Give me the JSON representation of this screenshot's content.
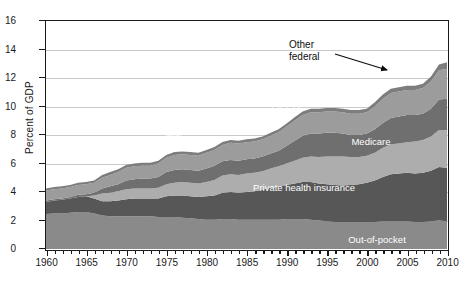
{
  "chart_data": {
    "type": "area",
    "title": "",
    "subtitle": "",
    "xlabel": "",
    "ylabel": "Percent of GDP",
    "xlim": [
      1960,
      2010
    ],
    "ylim": [
      0,
      16
    ],
    "yticks": [
      0,
      2,
      4,
      6,
      8,
      10,
      12,
      14,
      16
    ],
    "xticks": [
      1960,
      1965,
      1970,
      1975,
      1980,
      1985,
      1990,
      1995,
      2000,
      2005,
      2010
    ],
    "xtick_minor_step": 1,
    "grid": "horizontal",
    "legend_position": "inline-labels",
    "stacked": true,
    "x": [
      1960,
      1961,
      1962,
      1963,
      1964,
      1965,
      1966,
      1967,
      1968,
      1969,
      1970,
      1971,
      1972,
      1973,
      1974,
      1975,
      1976,
      1977,
      1978,
      1979,
      1980,
      1981,
      1982,
      1983,
      1984,
      1985,
      1986,
      1987,
      1988,
      1989,
      1990,
      1991,
      1992,
      1993,
      1994,
      1995,
      1996,
      1997,
      1998,
      1999,
      2000,
      2001,
      2002,
      2003,
      2004,
      2005,
      2006,
      2007,
      2008,
      2009,
      2010
    ],
    "series": [
      {
        "name": "Out-of-pocket",
        "color": "#8a8a8a",
        "values": [
          2.45,
          2.5,
          2.5,
          2.55,
          2.6,
          2.6,
          2.5,
          2.35,
          2.3,
          2.3,
          2.3,
          2.3,
          2.3,
          2.3,
          2.25,
          2.25,
          2.25,
          2.2,
          2.15,
          2.1,
          2.05,
          2.05,
          2.1,
          2.1,
          2.05,
          2.05,
          2.05,
          2.05,
          2.05,
          2.05,
          2.1,
          2.1,
          2.1,
          2.05,
          2.0,
          1.95,
          1.9,
          1.9,
          1.9,
          1.9,
          1.9,
          1.9,
          1.95,
          1.95,
          1.95,
          1.95,
          1.9,
          1.9,
          1.95,
          2.0,
          1.95
        ]
      },
      {
        "name": "Private health insurance",
        "color": "#575757",
        "values": [
          0.85,
          0.9,
          0.95,
          1.0,
          1.05,
          1.1,
          1.05,
          1.0,
          1.05,
          1.1,
          1.2,
          1.25,
          1.25,
          1.25,
          1.3,
          1.45,
          1.5,
          1.55,
          1.55,
          1.55,
          1.65,
          1.7,
          1.85,
          1.9,
          1.9,
          1.95,
          2.0,
          2.1,
          2.25,
          2.3,
          2.4,
          2.5,
          2.6,
          2.65,
          2.6,
          2.6,
          2.6,
          2.55,
          2.6,
          2.65,
          2.75,
          2.9,
          3.1,
          3.3,
          3.35,
          3.4,
          3.4,
          3.45,
          3.55,
          3.75,
          3.75
        ]
      },
      {
        "name": "Medicare",
        "color": "#adadad",
        "values": [
          0.0,
          0.0,
          0.0,
          0.0,
          0.0,
          0.0,
          0.2,
          0.55,
          0.6,
          0.65,
          0.7,
          0.7,
          0.7,
          0.7,
          0.75,
          0.85,
          0.9,
          0.95,
          0.95,
          0.95,
          1.0,
          1.1,
          1.2,
          1.25,
          1.25,
          1.3,
          1.3,
          1.3,
          1.35,
          1.45,
          1.5,
          1.6,
          1.7,
          1.8,
          1.85,
          1.95,
          2.0,
          2.05,
          1.95,
          1.9,
          1.9,
          1.95,
          2.05,
          2.1,
          2.1,
          2.15,
          2.25,
          2.3,
          2.4,
          2.6,
          2.65
        ]
      },
      {
        "name": "State and federal medicaid & CHIP",
        "color": "#6f6f6f",
        "values": [
          0.1,
          0.1,
          0.1,
          0.1,
          0.15,
          0.15,
          0.2,
          0.35,
          0.45,
          0.5,
          0.6,
          0.65,
          0.7,
          0.7,
          0.75,
          0.85,
          0.9,
          0.9,
          0.9,
          0.9,
          0.95,
          1.0,
          1.0,
          1.0,
          1.0,
          1.0,
          1.0,
          1.05,
          1.05,
          1.1,
          1.25,
          1.4,
          1.55,
          1.6,
          1.65,
          1.65,
          1.65,
          1.6,
          1.55,
          1.55,
          1.55,
          1.65,
          1.75,
          1.85,
          1.9,
          1.9,
          1.85,
          1.85,
          1.95,
          2.15,
          2.2
        ]
      },
      {
        "name": "Other third-party",
        "color": "#9c9c9c",
        "values": [
          0.7,
          0.7,
          0.7,
          0.7,
          0.7,
          0.7,
          0.7,
          0.75,
          0.8,
          0.85,
          0.9,
          0.9,
          0.9,
          0.9,
          0.95,
          1.0,
          1.05,
          1.05,
          1.05,
          1.05,
          1.1,
          1.1,
          1.15,
          1.2,
          1.2,
          1.2,
          1.2,
          1.2,
          1.25,
          1.3,
          1.35,
          1.4,
          1.45,
          1.5,
          1.5,
          1.5,
          1.5,
          1.5,
          1.5,
          1.5,
          1.5,
          1.6,
          1.7,
          1.75,
          1.75,
          1.75,
          1.75,
          1.8,
          1.9,
          2.05,
          2.1
        ]
      },
      {
        "name": "Other federal",
        "color": "#7d7d7d",
        "values": [
          0.15,
          0.15,
          0.15,
          0.15,
          0.15,
          0.15,
          0.15,
          0.2,
          0.2,
          0.2,
          0.2,
          0.2,
          0.2,
          0.2,
          0.2,
          0.2,
          0.2,
          0.2,
          0.2,
          0.2,
          0.2,
          0.2,
          0.2,
          0.2,
          0.2,
          0.2,
          0.2,
          0.2,
          0.2,
          0.2,
          0.2,
          0.25,
          0.25,
          0.25,
          0.25,
          0.25,
          0.25,
          0.25,
          0.25,
          0.25,
          0.25,
          0.3,
          0.3,
          0.3,
          0.3,
          0.3,
          0.3,
          0.3,
          0.35,
          0.4,
          0.45
        ]
      }
    ],
    "totals": [
      4.25,
      4.35,
      4.4,
      4.5,
      4.65,
      4.7,
      4.8,
      5.2,
      5.4,
      5.6,
      5.9,
      6.0,
      6.05,
      6.05,
      6.2,
      6.6,
      6.8,
      6.85,
      6.8,
      6.65,
      6.95,
      7.15,
      7.5,
      7.7,
      7.6,
      7.7,
      7.75,
      7.95,
      8.15,
      8.4,
      8.8,
      9.25,
      9.65,
      9.85,
      9.85,
      9.9,
      9.9,
      9.85,
      9.75,
      9.75,
      9.85,
      10.3,
      10.85,
      11.25,
      11.35,
      11.45,
      11.45,
      11.6,
      12.1,
      12.95,
      13.1
    ]
  },
  "annotations": [
    {
      "name": "other-federal-callout",
      "line1": "Other",
      "line2": "federal"
    }
  ],
  "band_labels": [
    {
      "key": "other-third-party",
      "text": "Other third-party"
    },
    {
      "key": "state-and-federal-medicaid-chip",
      "text": "State and federal medicaid & CHIP"
    },
    {
      "key": "medicare",
      "text": "Medicare"
    },
    {
      "key": "private-health-insurance",
      "text": "Private health insurance"
    },
    {
      "key": "out-of-pocket",
      "text": "Out-of-pocket"
    }
  ],
  "axis": {
    "y_title": "Percent of GDP",
    "y_labels": [
      "0",
      "2",
      "4",
      "6",
      "8",
      "10",
      "12",
      "14",
      "16"
    ],
    "x_labels": [
      "1960",
      "1965",
      "1970",
      "1975",
      "1980",
      "1985",
      "1990",
      "1995",
      "2000",
      "2005",
      "2010"
    ]
  },
  "colors": {
    "out_of_pocket": "#8a8a8a",
    "private_health_insurance": "#575757",
    "medicare": "#adadad",
    "medicaid_chip": "#6f6f6f",
    "other_third_party": "#9c9c9c",
    "other_federal": "#7d7d7d",
    "frame": "#1a1a1a",
    "gridline": "#c9c9c9",
    "background": "#ffffff",
    "label_text": "#ffffff"
  }
}
